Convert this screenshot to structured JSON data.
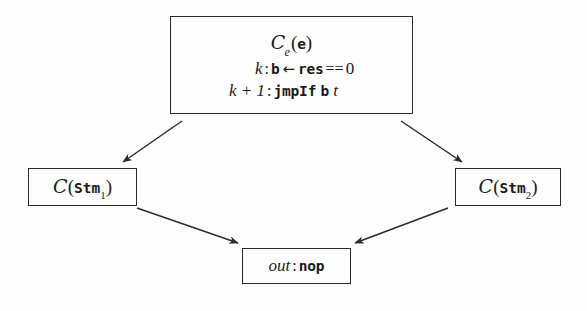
{
  "figure": {
    "type": "flow-diagram",
    "background_color": "#fefefe",
    "stroke_color": "#2b2b2b"
  },
  "nodes": {
    "conditional": {
      "name": "conditional-code-block",
      "line1": {
        "cal": "C",
        "sub": "e",
        "open": "(",
        "arg": "e",
        "close": ")"
      },
      "line2": {
        "label": "k",
        "colon": ":",
        "target": "b",
        "assign": "←",
        "expr": "res",
        "eq": "==",
        "value": "0"
      },
      "line3": {
        "label": "k + 1",
        "colon": ":",
        "instr": "jmpIf",
        "operand": "b",
        "target": "t"
      }
    },
    "stm1": {
      "name": "compile-stm1",
      "cal": "C",
      "open": "(",
      "arg": "Stm",
      "sub": "1",
      "close": ")"
    },
    "stm2": {
      "name": "compile-stm2",
      "cal": "C",
      "open": "(",
      "arg": "Stm",
      "sub": "2",
      "close": ")"
    },
    "out": {
      "name": "out-nop-block",
      "label": "out",
      "colon": ":",
      "instr": "nop"
    }
  },
  "edges": [
    {
      "name": "edge-cond-to-stm1",
      "from": "conditional",
      "to": "stm1"
    },
    {
      "name": "edge-cond-to-stm2",
      "from": "conditional",
      "to": "stm2"
    },
    {
      "name": "edge-stm1-to-out",
      "from": "stm1",
      "to": "out"
    },
    {
      "name": "edge-stm2-to-out",
      "from": "stm2",
      "to": "out"
    }
  ]
}
